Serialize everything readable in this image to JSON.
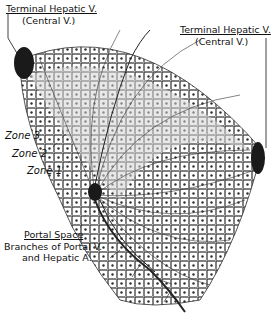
{
  "labels": {
    "central_vein_left": {
      "line1": "Terminal Hepatic V.",
      "line2": "(Central V.)"
    },
    "central_vein_right": {
      "line1": "Terminal Hepatic V.",
      "line2": "(Central V.)"
    },
    "zone3": "Zone 3",
    "zone2": "Zone 2",
    "zone1": "Zone 1",
    "portal_space": {
      "title": "Portal Space",
      "line1": "Branches of Portal V.",
      "line2": "and Hepatic A."
    }
  },
  "colors": {
    "ink": "#111111",
    "vein": "#1a1a1a",
    "shade": "#d6d6d6",
    "background": "#ffffff"
  }
}
